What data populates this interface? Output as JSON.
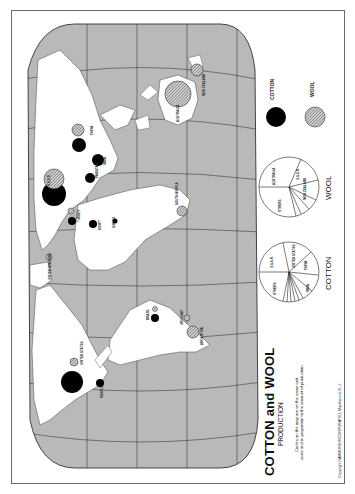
{
  "map": {
    "title": "COTTON and WOOL",
    "subtitle": "PRODUCTION",
    "note_line1": "Circles on the map are on the same unit",
    "note_line2": "scale and in proportion to the amount of production.",
    "copyright": "Copyright HAMMOND INCORPORATED, Maplewood, N. J.",
    "orientation": "rotated 90° counter-clockwise",
    "colors": {
      "ocean": "#b9b9b9",
      "land": "#ffffff",
      "cotton": "#000000",
      "wool": "#a8a8a8",
      "grid": "#3a3a3a"
    }
  },
  "legend": {
    "cotton_label": "COTTON",
    "wool_label": "WOOL"
  },
  "pies": {
    "wool": {
      "title": "WOOL",
      "slices": [
        "AUSTRALIA",
        "U.S.S.R.",
        "NEW ZEALAND",
        "CHINA",
        "S. AFRICA",
        "ARGENTINA",
        "URUGUAY",
        "OTHERS"
      ]
    },
    "cotton": {
      "title": "COTTON",
      "slices": [
        "U.S.S.R.",
        "UNITED STATES",
        "CHINA",
        "INDIA",
        "PAKISTAN",
        "EGYPT",
        "BRAZIL",
        "MEXICO",
        "TURKEY",
        "SUDAN",
        "OTHERS"
      ]
    }
  },
  "labels": {
    "ussr": "U.S.S.R.",
    "china": "CHINA",
    "pakistan": "PAKISTAN",
    "india": "INDIA",
    "turkey": "TURKEY",
    "egypt": "EGYPT",
    "sudan": "SUDAN",
    "south_africa": "SOUTH AFRICA",
    "australia": "AUSTRALIA",
    "new_zealand": "NEW ZEALAND",
    "united_kingdom": "UNITED KINGDOM",
    "united_states": "UNITED STATES",
    "mexico": "MEXICO",
    "brazil": "BRAZIL",
    "uruguay": "URUGUAY",
    "argentina": "ARGENTINA"
  }
}
